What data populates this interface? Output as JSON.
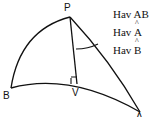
{
  "diagram": {
    "type": "spherical-triangle",
    "vertices": [
      {
        "id": "P",
        "label": "P"
      },
      {
        "id": "B",
        "label": "B"
      },
      {
        "id": "V",
        "label": "V"
      },
      {
        "id": "A",
        "label": "A"
      }
    ],
    "formulas": [
      {
        "prefix": "Hav ",
        "term": "AB"
      },
      {
        "prefix": "Hav ",
        "term": "A",
        "hat": true
      },
      {
        "prefix": "Hav ",
        "term": "B",
        "hat": true
      }
    ],
    "stroke_color": "#111111"
  }
}
